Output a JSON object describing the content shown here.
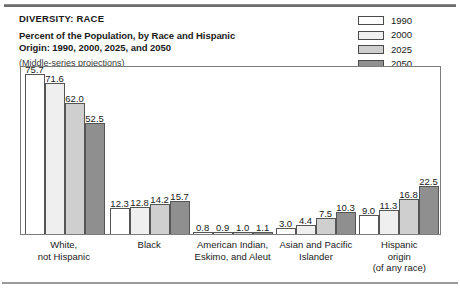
{
  "header": {
    "kicker": "DIVERSITY: RACE",
    "title_line1": "Percent of the Population, by Race and Hispanic",
    "title_line2": "Origin: 1990, 2000, 2025, and 2050",
    "note": "(Middle-series projections)"
  },
  "legend": {
    "items": [
      {
        "label": "1990",
        "color": "#ffffff"
      },
      {
        "label": "2000",
        "color": "#efefef"
      },
      {
        "label": "2025",
        "color": "#cfcfcf"
      },
      {
        "label": "2050",
        "color": "#8f8f8f"
      }
    ]
  },
  "chart_data": {
    "type": "bar",
    "title": "Percent of the Population, by Race and Hispanic Origin: 1990, 2000, 2025, and 2050",
    "subtitle": "(Middle-series projections)",
    "xlabel": "",
    "ylabel": "",
    "ylim": [
      0,
      80
    ],
    "grid": false,
    "legend_position": "top-right",
    "categories": [
      "White, not Hispanic",
      "Black",
      "American Indian, Eskimo, and Aleut",
      "Asian and Pacific Islander",
      "Hispanic origin (of any race)"
    ],
    "category_lines": [
      [
        "White,",
        "not Hispanic"
      ],
      [
        "Black"
      ],
      [
        "American Indian,",
        "Eskimo, and Aleut"
      ],
      [
        "Asian and Pacific",
        "Islander"
      ],
      [
        "Hispanic",
        "origin",
        "(of any race)"
      ]
    ],
    "series": [
      {
        "name": "1990",
        "color": "#ffffff",
        "values": [
          75.7,
          12.3,
          0.8,
          3.0,
          9.0
        ]
      },
      {
        "name": "2000",
        "color": "#efefef",
        "values": [
          71.6,
          12.8,
          0.9,
          4.4,
          11.3
        ]
      },
      {
        "name": "2025",
        "color": "#cfcfcf",
        "values": [
          62.0,
          14.2,
          1.0,
          7.5,
          16.8
        ]
      },
      {
        "name": "2050",
        "color": "#8f8f8f",
        "values": [
          52.5,
          15.7,
          1.1,
          10.3,
          22.5
        ]
      }
    ]
  }
}
